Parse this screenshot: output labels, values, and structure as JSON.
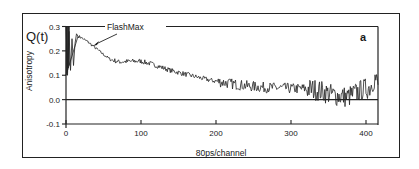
{
  "chart_data": {
    "type": "line",
    "title": "",
    "panel_label": "a",
    "xlabel": "80ps/channel",
    "ylabel": "Anisotropy",
    "y_symbol": "Q(t)",
    "annotation": {
      "text": "FlashMax",
      "points_to_channel": 36,
      "points_to_value": 0.22
    },
    "xlim": [
      0,
      420
    ],
    "ylim": [
      -0.1,
      0.3
    ],
    "x_ticks": [
      0,
      100,
      200,
      300,
      400
    ],
    "x_tick_labels": [
      "0",
      "100",
      "200",
      "300",
      "400"
    ],
    "y_ticks": [
      -0.1,
      0.0,
      0.1,
      0.2,
      0.3
    ],
    "y_tick_labels": [
      "-0.1",
      "0.0",
      "0.1",
      "0.2",
      "0.3"
    ],
    "grid": false,
    "legend": null,
    "reference_line": {
      "y": 0.0
    },
    "series": [
      {
        "name": "Anisotropy decay",
        "x": [
          0,
          2,
          4,
          6,
          8,
          10,
          12,
          14,
          16,
          20,
          25,
          30,
          36,
          42,
          50,
          59,
          70,
          85,
          99,
          112,
          125,
          139,
          152,
          165,
          178,
          192,
          210,
          225,
          245,
          265,
          285,
          305,
          320,
          335,
          345,
          355,
          365,
          375,
          385,
          395,
          405,
          412,
          416
        ],
        "y": [
          0.3,
          0.1,
          0.28,
          0.12,
          0.25,
          0.14,
          0.23,
          0.27,
          0.26,
          0.255,
          0.245,
          0.235,
          0.22,
          0.205,
          0.185,
          0.165,
          0.155,
          0.157,
          0.158,
          0.148,
          0.135,
          0.12,
          0.11,
          0.1,
          0.09,
          0.08,
          0.07,
          0.063,
          0.055,
          0.05,
          0.048,
          0.045,
          0.045,
          0.04,
          0.03,
          0.02,
          0.015,
          0.01,
          0.025,
          0.04,
          0.05,
          0.09,
          0.06
        ]
      }
    ]
  }
}
